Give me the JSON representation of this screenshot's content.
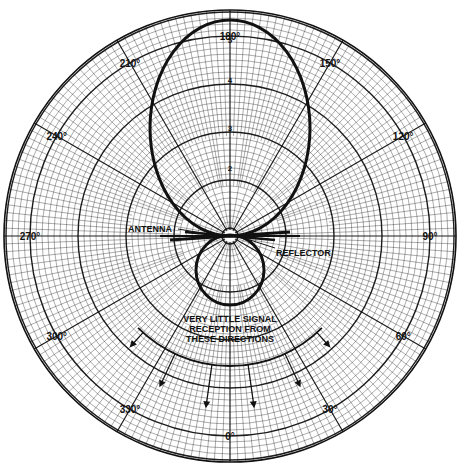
{
  "chart_data": {
    "type": "polar",
    "title": "",
    "angle_labels": [
      "180°",
      "150°",
      "120°",
      "90°",
      "60°",
      "30°",
      "0°",
      "330°",
      "300°",
      "270°",
      "240°",
      "210°"
    ],
    "angle_values_deg": [
      180,
      150,
      120,
      90,
      60,
      30,
      0,
      330,
      300,
      270,
      240,
      210
    ],
    "radial_labels": [
      "5",
      "4",
      "3",
      "2"
    ],
    "radial_range": [
      0,
      5
    ],
    "series": [
      {
        "name": "Main lobe (toward 180°)",
        "peak_direction_deg": 180,
        "relative_magnitude": 5.0
      },
      {
        "name": "Back lobe (toward 0°)",
        "peak_direction_deg": 0,
        "relative_magnitude": 1.6
      }
    ],
    "annotations": {
      "antenna": "ANTENNA",
      "reflector": "REFLECTOR",
      "note_line1": "VERY LITTLE SIGNAL",
      "note_line2": "RECEPTION FROM",
      "note_line3": "THESE DIRECTIONS"
    },
    "grid": true,
    "legend": "none"
  }
}
